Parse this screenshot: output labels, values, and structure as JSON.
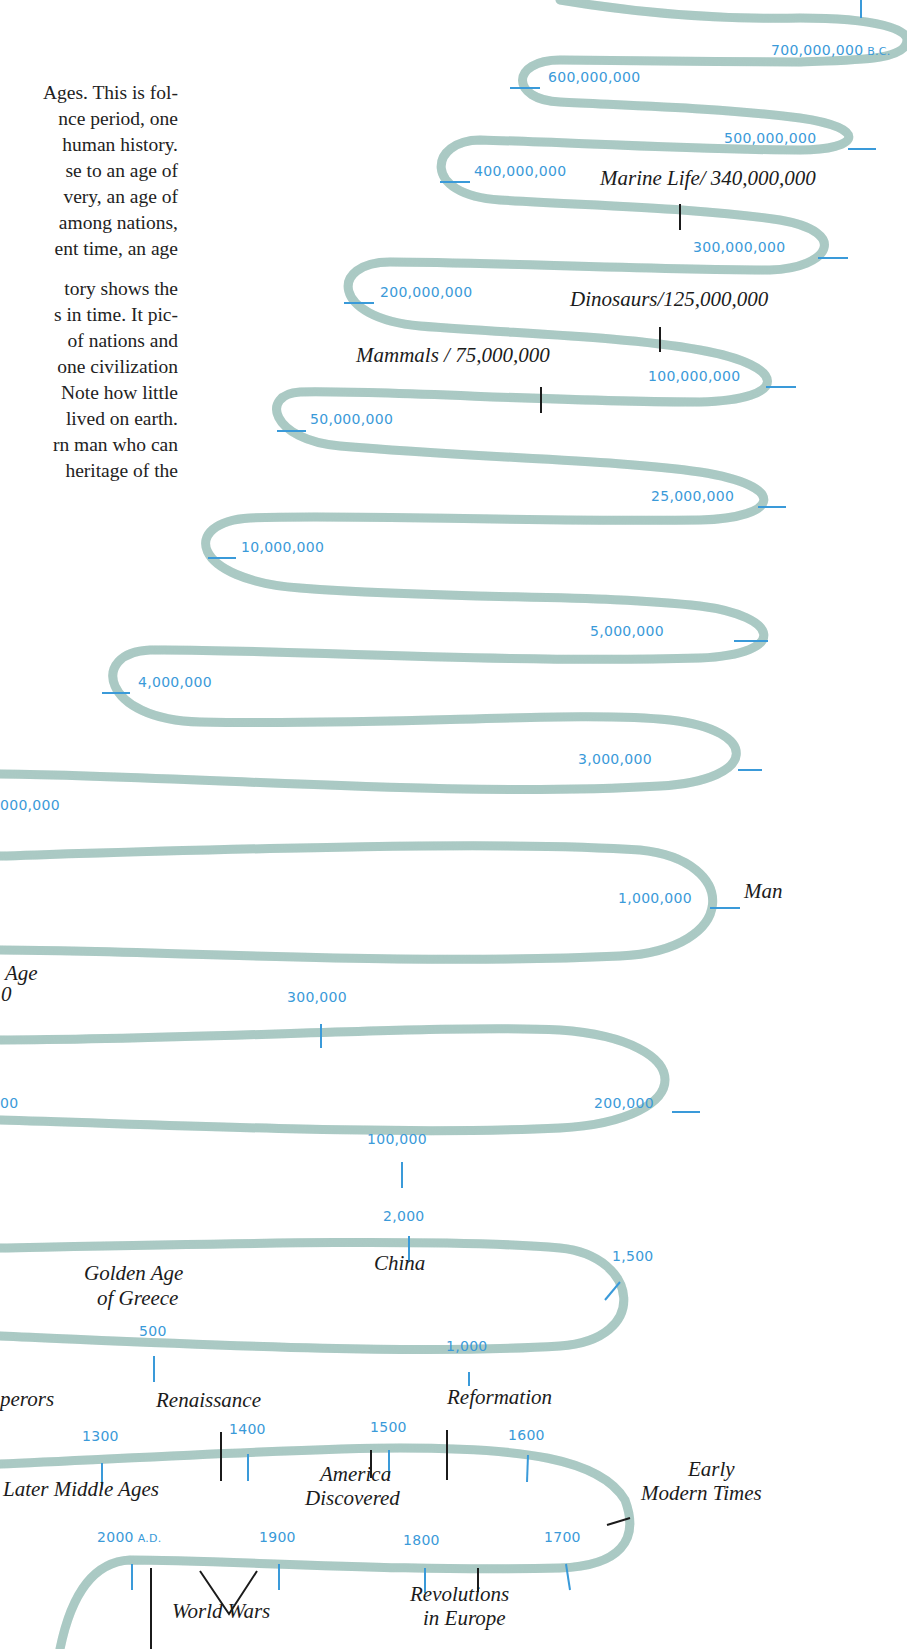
{
  "body_text": {
    "lines": [
      {
        "text": "Ages. This is fol-",
        "top": 94
      },
      {
        "text": "nce period, one",
        "top": 120
      },
      {
        "text": "human history.",
        "top": 146
      },
      {
        "text": "se to an age of",
        "top": 172
      },
      {
        "text": "very, an age of",
        "top": 198
      },
      {
        "text": "among nations,",
        "top": 224
      },
      {
        "text": "ent time, an age",
        "top": 250
      },
      {
        "text": "tory shows the",
        "top": 290
      },
      {
        "text": "s in time. It pic-",
        "top": 316
      },
      {
        "text": "of nations and",
        "top": 342
      },
      {
        "text": "one civilization",
        "top": 368
      },
      {
        "text": "Note how little",
        "top": 394
      },
      {
        "text": "lived on earth.",
        "top": 420
      },
      {
        "text": "rn man who can",
        "top": 446
      },
      {
        "text": "heritage of the",
        "top": 472
      }
    ]
  },
  "timeline": {
    "ribbon_color": "#a9c9c3",
    "tick_color": "#3a9ad9",
    "event_color": "#1b1b1b",
    "tick_labels": [
      {
        "id": "700m",
        "text": "700,000,000",
        "suffix": "B.C.",
        "x": 771,
        "y": 51
      },
      {
        "id": "600m",
        "text": "600,000,000",
        "x": 548,
        "y": 78
      },
      {
        "id": "500m",
        "text": "500,000,000",
        "x": 724,
        "y": 139
      },
      {
        "id": "400m",
        "text": "400,000,000",
        "x": 474,
        "y": 172
      },
      {
        "id": "300m",
        "text": "300,000,000",
        "x": 693,
        "y": 248
      },
      {
        "id": "200m",
        "text": "200,000,000",
        "x": 380,
        "y": 293
      },
      {
        "id": "100m",
        "text": "100,000,000",
        "x": 648,
        "y": 377
      },
      {
        "id": "50m",
        "text": "50,000,000",
        "x": 310,
        "y": 420
      },
      {
        "id": "25m",
        "text": "25,000,000",
        "x": 651,
        "y": 497
      },
      {
        "id": "10m",
        "text": "10,000,000",
        "x": 241,
        "y": 548
      },
      {
        "id": "5m",
        "text": "5,000,000",
        "x": 590,
        "y": 632
      },
      {
        "id": "4m",
        "text": "4,000,000",
        "x": 138,
        "y": 683
      },
      {
        "id": "3m",
        "text": "3,000,000",
        "x": 578,
        "y": 760
      },
      {
        "id": "2m",
        "text": "000,000",
        "x": 0,
        "y": 806
      },
      {
        "id": "1m",
        "text": "1,000,000",
        "x": 618,
        "y": 899
      },
      {
        "id": "300k",
        "text": "300,000",
        "x": 287,
        "y": 998
      },
      {
        "id": "250k",
        "text": "00",
        "x": 0,
        "y": 1104
      },
      {
        "id": "200k",
        "text": "200,000",
        "x": 594,
        "y": 1104
      },
      {
        "id": "100k",
        "text": "100,000",
        "x": 367,
        "y": 1140
      },
      {
        "id": "2000bc",
        "text": "2,000",
        "x": 383,
        "y": 1217
      },
      {
        "id": "1500bc",
        "text": "1,500",
        "x": 612,
        "y": 1257
      },
      {
        "id": "500bc",
        "text": "500",
        "x": 139,
        "y": 1332
      },
      {
        "id": "1000bc",
        "text": "1,000",
        "x": 446,
        "y": 1347
      },
      {
        "id": "1300",
        "text": "1300",
        "x": 82,
        "y": 1437
      },
      {
        "id": "1400",
        "text": "1400",
        "x": 229,
        "y": 1430
      },
      {
        "id": "1500",
        "text": "1500",
        "x": 370,
        "y": 1428
      },
      {
        "id": "1600",
        "text": "1600",
        "x": 508,
        "y": 1436
      },
      {
        "id": "2000ad",
        "text": "2000",
        "suffix": "A.D.",
        "x": 97,
        "y": 1538
      },
      {
        "id": "1900",
        "text": "1900",
        "x": 259,
        "y": 1538
      },
      {
        "id": "1800",
        "text": "1800",
        "x": 403,
        "y": 1541
      },
      {
        "id": "1700",
        "text": "1700",
        "x": 544,
        "y": 1538
      }
    ],
    "events": [
      {
        "id": "marine-life",
        "text": "Marine Life/ 340,000,000",
        "x": 600,
        "y": 184
      },
      {
        "id": "dinosaurs",
        "text": "Dinosaurs/125,000,000",
        "x": 570,
        "y": 305
      },
      {
        "id": "mammals",
        "text": "Mammals / 75,000,000",
        "x": 356,
        "y": 361
      },
      {
        "id": "man",
        "text": "Man",
        "x": 744,
        "y": 897
      },
      {
        "id": "age-partial",
        "text": "Age",
        "x": 5,
        "y": 979
      },
      {
        "id": "age-partial-2",
        "text": "0",
        "x": 1,
        "y": 1000
      },
      {
        "id": "china",
        "text": "China",
        "x": 374,
        "y": 1269
      },
      {
        "id": "golden-age",
        "text": "Golden Age",
        "x": 84,
        "y": 1279
      },
      {
        "id": "golden-age-2",
        "text": "of Greece",
        "x": 97,
        "y": 1304
      },
      {
        "id": "emperors",
        "text": "perors",
        "x": 0,
        "y": 1405
      },
      {
        "id": "renaissance",
        "text": "Renaissance",
        "x": 156,
        "y": 1406
      },
      {
        "id": "reformation",
        "text": "Reformation",
        "x": 447,
        "y": 1403
      },
      {
        "id": "later-middle-ages",
        "text": "Later Middle Ages",
        "x": 3,
        "y": 1495
      },
      {
        "id": "america",
        "text": "America",
        "x": 320,
        "y": 1480
      },
      {
        "id": "america-2",
        "text": "Discovered",
        "x": 305,
        "y": 1504
      },
      {
        "id": "early",
        "text": "Early",
        "x": 688,
        "y": 1475
      },
      {
        "id": "early-2",
        "text": "Modern Times",
        "x": 641,
        "y": 1499
      },
      {
        "id": "revolutions",
        "text": "Revolutions",
        "x": 410,
        "y": 1600
      },
      {
        "id": "revolutions-2",
        "text": "in Europe",
        "x": 423,
        "y": 1624
      },
      {
        "id": "world-wars",
        "text": "World Wars",
        "x": 172,
        "y": 1617
      }
    ]
  }
}
